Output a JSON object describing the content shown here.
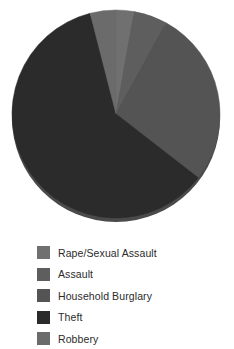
{
  "chart_data": {
    "type": "pie",
    "title": "",
    "subtitle": "",
    "xlabel": "",
    "ylabel": "",
    "grid": false,
    "legend_position": "bottom-left",
    "start_angle_deg": 0,
    "direction": "clockwise",
    "categories": [
      "Rape/Sexual Assault",
      "Assault",
      "Household Burglary",
      "Theft",
      "Robbery"
    ],
    "values": [
      2.8,
      5.2,
      27.5,
      60.5,
      4.0
    ],
    "units": "percent",
    "colors": [
      "#707070",
      "#5e5e5e",
      "#545454",
      "#2b2b2b",
      "#6b6b6b"
    ],
    "slices": [
      {
        "label": "Rape/Sexual Assault",
        "value": 2.8,
        "color": "#707070",
        "start_deg": 0.0,
        "end_deg": 10.1
      },
      {
        "label": "Assault",
        "value": 5.2,
        "color": "#5e5e5e",
        "start_deg": 10.1,
        "end_deg": 28.8
      },
      {
        "label": "Household Burglary",
        "value": 27.5,
        "color": "#545454",
        "start_deg": 28.8,
        "end_deg": 127.8
      },
      {
        "label": "Theft",
        "value": 60.5,
        "color": "#2b2b2b",
        "start_deg": 127.8,
        "end_deg": 345.6
      },
      {
        "label": "Robbery",
        "value": 4.0,
        "color": "#6b6b6b",
        "start_deg": 345.6,
        "end_deg": 360.0
      }
    ]
  },
  "legend": {
    "items": [
      {
        "label": "Rape/Sexual Assault",
        "color": "#707070"
      },
      {
        "label": "Assault",
        "color": "#5e5e5e"
      },
      {
        "label": "Household Burglary",
        "color": "#545454"
      },
      {
        "label": "Theft",
        "color": "#2b2b2b"
      },
      {
        "label": "Robbery",
        "color": "#6b6b6b"
      }
    ]
  },
  "style": {
    "background": "#ffffff",
    "rim_shadow": "#4a4a4a",
    "text_color": "#2b2b2b"
  },
  "geometry": {
    "center_x": 116,
    "center_y": 114,
    "radius": 104,
    "rim_offset_y": 4
  }
}
